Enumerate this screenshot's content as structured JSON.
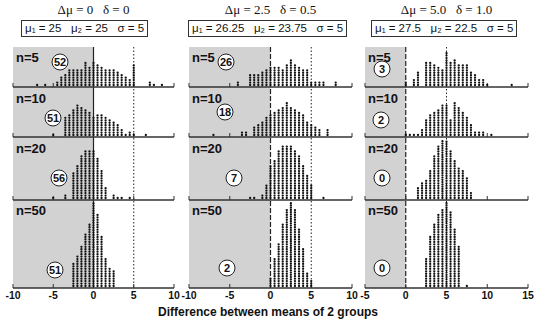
{
  "chart_data": {
    "type": "scatter",
    "subtype": "dot-plot-grid",
    "xlabel": "Difference between means of 2 groups",
    "rows": [
      "n=5",
      "n=10",
      "n=20",
      "n=50"
    ],
    "panels": [
      {
        "title": "Δμ = 0   δ = 0",
        "params": "μ₁ = 25   μ₂ = 25   σ = 5",
        "xlim": [
          -10,
          10
        ],
        "xticks": [
          "-10",
          "-5",
          "0",
          "5",
          "10"
        ],
        "dashed_line_x": 0,
        "dotted_line_x": 5,
        "shaded_below": 0,
        "counts_below_zero": [
          52,
          51,
          56,
          51
        ],
        "distributions": [
          {
            "x": [
              -7,
              -6,
              -4.5,
              -4,
              -3.5,
              -3,
              -2.5,
              -2,
              -1.5,
              -1,
              -0.5,
              0,
              0.5,
              1,
              1.5,
              2,
              2.5,
              3,
              3.5,
              4,
              4.5,
              5,
              7,
              7.5,
              8.5
            ],
            "n": [
              1,
              1,
              2,
              4,
              5,
              7,
              7,
              7,
              7,
              10,
              8,
              10,
              9,
              8,
              7,
              7,
              7,
              6,
              5,
              4,
              3,
              9,
              2,
              1,
              1
            ]
          },
          {
            "x": [
              -5,
              -3.5,
              -3,
              -2.5,
              -2,
              -1.5,
              -1,
              -0.5,
              0,
              0.5,
              1,
              1.5,
              2,
              2.5,
              3,
              3.5,
              4,
              4.5,
              5,
              6.5
            ],
            "n": [
              1,
              8,
              9,
              11,
              13,
              12,
              11,
              10,
              8,
              9,
              9,
              8,
              7,
              6,
              5,
              3,
              1,
              2,
              1,
              1
            ]
          },
          {
            "x": [
              -5,
              -3.5,
              -2.5,
              -2,
              -1.5,
              -1,
              -0.5,
              0,
              0.5,
              1,
              1.5,
              2.5,
              3,
              3.5,
              4.5
            ],
            "n": [
              1,
              2,
              11,
              14,
              18,
              20,
              20,
              20,
              17,
              12,
              5,
              2,
              1,
              1,
              1
            ]
          },
          {
            "x": [
              -2.5,
              -2,
              -1.5,
              -1,
              -0.5,
              0,
              0.5,
              1,
              1.5,
              2,
              2.5
            ],
            "n": [
              10,
              13,
              17,
              22,
              26,
              35,
              30,
              21,
              12,
              8,
              7
            ]
          }
        ]
      },
      {
        "title": "Δμ = 2.5   δ = 0.5",
        "params": "μ₁ = 26.25   μ₂ = 23.75   σ = 5",
        "xlim": [
          -10,
          10
        ],
        "xticks": [
          "-10",
          "-5",
          "0",
          "5",
          "10"
        ],
        "dashed_line_x": 0,
        "dotted_line_x": 5,
        "shaded_below": 0,
        "counts_below_zero": [
          26,
          18,
          7,
          2
        ],
        "distributions": [
          {
            "x": [
              -4,
              -2.5,
              -2,
              -1.5,
              -1,
              -0.5,
              0,
              0.5,
              1,
              1.5,
              2,
              2.5,
              3,
              3.5,
              4,
              4.5,
              5,
              5.5,
              6,
              6.5,
              8
            ],
            "n": [
              2,
              5,
              5,
              5,
              6,
              7,
              8,
              8,
              8,
              7,
              9,
              11,
              9,
              8,
              7,
              7,
              2,
              2,
              2,
              2,
              2
            ]
          },
          {
            "x": [
              -7,
              -3.5,
              -3,
              -2,
              -1.5,
              -1,
              -0.5,
              0,
              0.5,
              1,
              1.5,
              2,
              2.5,
              3,
              3.5,
              4,
              4.5,
              5,
              5.5,
              6,
              7
            ],
            "n": [
              1,
              2,
              2,
              4,
              5,
              6,
              8,
              9,
              10,
              11,
              12,
              14,
              12,
              11,
              10,
              9,
              6,
              5,
              4,
              3,
              3
            ]
          },
          {
            "x": [
              -2.5,
              -2,
              -1,
              -0.5,
              0,
              0.5,
              1,
              1.5,
              2,
              2.5,
              3,
              3.5,
              4,
              4.5,
              5,
              6.5
            ],
            "n": [
              1,
              1,
              2,
              6,
              14,
              16,
              20,
              22,
              22,
              22,
              20,
              18,
              14,
              10,
              6,
              1
            ]
          },
          {
            "x": [
              0,
              0.5,
              1,
              1.5,
              2,
              2.5,
              3,
              3.5,
              4,
              4.5,
              5
            ],
            "n": [
              4,
              12,
              18,
              26,
              32,
              38,
              32,
              24,
              16,
              6,
              3
            ]
          }
        ]
      },
      {
        "title": "Δμ = 5.0   δ = 1.0",
        "params": "μ₁ = 27.5   μ₂ = 22.5   σ = 5",
        "xlim": [
          -5,
          15
        ],
        "xticks": [
          "-5",
          "0",
          "5",
          "10",
          "15"
        ],
        "dashed_line_x": 0,
        "dotted_line_x": 5,
        "shaded_below": 0,
        "counts_below_zero": [
          3,
          2,
          0,
          0
        ],
        "distributions": [
          {
            "x": [
              0,
              1,
              1.5,
              2.5,
              3,
              3.5,
              4,
              4.5,
              5,
              5.5,
              6,
              6.5,
              7,
              7.5,
              8,
              8.5,
              9,
              9.5,
              10,
              13
            ],
            "n": [
              2,
              3,
              6,
              10,
              10,
              9,
              8,
              7,
              14,
              10,
              11,
              9,
              9,
              9,
              6,
              5,
              3,
              3,
              1,
              1
            ]
          },
          {
            "x": [
              0,
              0.5,
              1,
              1.5,
              2,
              2.5,
              3,
              3.5,
              4,
              4.5,
              5,
              5.5,
              6,
              6.5,
              7,
              7.5,
              8,
              8.5,
              9,
              9.5,
              10.5
            ],
            "n": [
              1,
              1,
              1,
              1,
              3,
              7,
              9,
              10,
              11,
              13,
              13,
              7,
              14,
              12,
              10,
              8,
              5,
              2,
              2,
              2,
              1
            ]
          },
          {
            "x": [
              1.5,
              2,
              2.5,
              3,
              3.5,
              4,
              4.5,
              5,
              5.5,
              6,
              6.5,
              7,
              7.5,
              8
            ],
            "n": [
              5,
              7,
              8,
              12,
              18,
              22,
              26,
              24,
              20,
              16,
              13,
              12,
              9,
              3
            ]
          },
          {
            "x": [
              2.5,
              3,
              3.5,
              4,
              4.5,
              5,
              5.5,
              6,
              6.5,
              7.5
            ],
            "n": [
              12,
              21,
              26,
              30,
              32,
              38,
              31,
              24,
              17,
              1
            ]
          }
        ]
      }
    ]
  }
}
